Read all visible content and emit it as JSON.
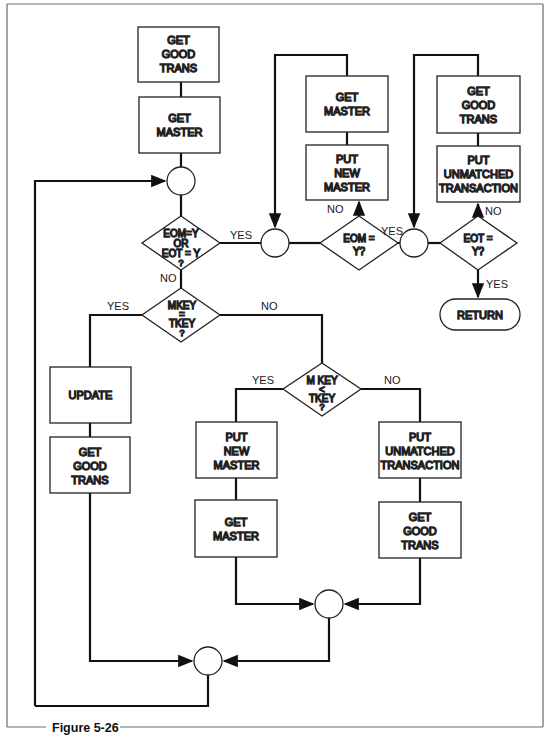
{
  "figure": {
    "caption": "Figure 5-26",
    "frame_color": "#6b6b6b",
    "line_color": "#111111"
  },
  "nodes": {
    "get_good_trans_1": {
      "lines": [
        "GET",
        "GOOD",
        "TRANS"
      ]
    },
    "get_master_1": {
      "lines": [
        "GET",
        "MASTER"
      ]
    },
    "decision_eom_or_eot": {
      "lines": [
        "EOM=Y",
        "OR",
        "EOT = Y",
        "?"
      ]
    },
    "get_master_2": {
      "lines": [
        "GET",
        "MASTER"
      ]
    },
    "put_new_master_1": {
      "lines": [
        "PUT",
        "NEW",
        "MASTER"
      ]
    },
    "decision_eom": {
      "lines": [
        "EOM =",
        "Y?"
      ]
    },
    "get_good_trans_2": {
      "lines": [
        "GET",
        "GOOD",
        "TRANS"
      ]
    },
    "put_unmatched_1": {
      "lines": [
        "PUT",
        "UNMATCHED",
        "TRANSACTION"
      ]
    },
    "decision_eot": {
      "lines": [
        "EOT =",
        "Y?"
      ]
    },
    "return": {
      "lines": [
        "RETURN"
      ]
    },
    "decision_mkey_eq_tkey": {
      "lines": [
        "MKEY",
        "=",
        "TKEY",
        "?"
      ]
    },
    "update": {
      "lines": [
        "UPDATE"
      ]
    },
    "get_good_trans_3": {
      "lines": [
        "GET",
        "GOOD",
        "TRANS"
      ]
    },
    "decision_mkey_lt_tkey": {
      "lines": [
        "M KEY",
        "<",
        "TKEY",
        "?"
      ]
    },
    "put_new_master_2": {
      "lines": [
        "PUT",
        "NEW",
        "MASTER"
      ]
    },
    "get_master_3": {
      "lines": [
        "GET",
        "MASTER"
      ]
    },
    "put_unmatched_2": {
      "lines": [
        "PUT",
        "UNMATCHED",
        "TRANSACTION"
      ]
    },
    "get_good_trans_4": {
      "lines": [
        "GET",
        "GOOD",
        "TRANS"
      ]
    }
  },
  "edge_labels": {
    "eom_or_eot_yes": "YES",
    "eom_or_eot_no": "NO",
    "eom_no": "NO",
    "eom_yes": "YES",
    "eot_no": "NO",
    "eot_yes": "YES",
    "mkey_eq_yes": "YES",
    "mkey_eq_no": "NO",
    "mkey_lt_yes": "YES",
    "mkey_lt_no": "NO"
  }
}
